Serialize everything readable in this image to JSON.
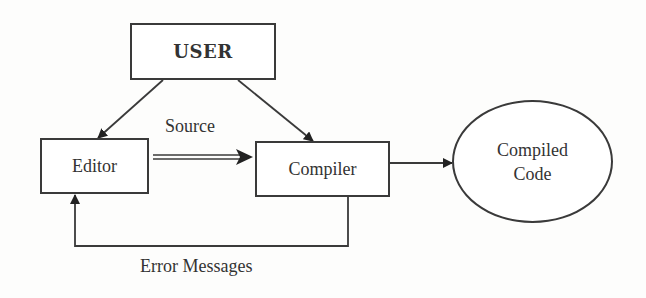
{
  "diagram": {
    "type": "flowchart",
    "nodes": {
      "user": {
        "label": "USER",
        "shape": "rectangle"
      },
      "editor": {
        "label": "Editor",
        "shape": "rectangle"
      },
      "compiler": {
        "label": "Compiler",
        "shape": "rectangle"
      },
      "output": {
        "line1": "Compiled",
        "line2": "Code",
        "shape": "ellipse"
      }
    },
    "edges": [
      {
        "from": "USER",
        "to": "Editor",
        "label": "",
        "style": "single-arrow"
      },
      {
        "from": "USER",
        "to": "Compiler",
        "label": "",
        "style": "single-arrow"
      },
      {
        "from": "Editor",
        "to": "Compiler",
        "label": "Source",
        "style": "double-line-arrow"
      },
      {
        "from": "Compiler",
        "to": "Compiled Code",
        "label": "",
        "style": "single-arrow"
      },
      {
        "from": "Compiler",
        "to": "Editor",
        "label": "Error Messages",
        "style": "elbow-arrow"
      }
    ],
    "labels": {
      "source": "Source",
      "error_messages": "Error Messages"
    },
    "colors": {
      "stroke": "#3a3a3a",
      "background": "#ffffff",
      "text": "#333333"
    }
  }
}
